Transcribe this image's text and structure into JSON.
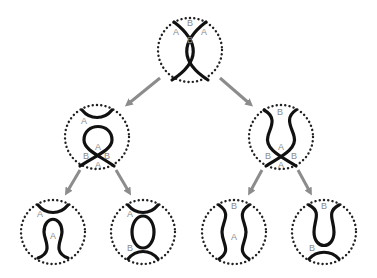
{
  "diagram": {
    "type": "tree of strand-resolution states",
    "colors": {
      "strand": "#111111",
      "boundary": "#222222",
      "label": "#8a8a8a",
      "arrow": "#8c8c8c"
    },
    "nodes": [
      {
        "id": "root",
        "description": "crossing (two strands cross twice)",
        "labels": [
          "A",
          "B",
          "A",
          "B"
        ]
      },
      {
        "id": "mid-left",
        "description": "A-resolution: cap on top, loop with crossing below",
        "labels": [
          "A",
          "A",
          "B",
          "B",
          "A"
        ]
      },
      {
        "id": "mid-right",
        "description": "B-resolution: cup shape with crossing below",
        "labels": [
          "B",
          "A",
          "B",
          "B",
          "A"
        ]
      },
      {
        "id": "leaf-AA",
        "description": "cap on top, bulb below",
        "labels": [
          "A",
          "A"
        ]
      },
      {
        "id": "leaf-AB",
        "description": "cap, closed loop, cup",
        "labels": [
          "A",
          "B"
        ]
      },
      {
        "id": "leaf-BA",
        "description": "two vertical wavy strands",
        "labels": [
          "B",
          "A"
        ]
      },
      {
        "id": "leaf-BB",
        "description": "cup shape and bottom cup",
        "labels": [
          "B",
          "B"
        ]
      }
    ],
    "edges": [
      {
        "from": "root",
        "to": "mid-left"
      },
      {
        "from": "root",
        "to": "mid-right"
      },
      {
        "from": "mid-left",
        "to": "leaf-AA"
      },
      {
        "from": "mid-left",
        "to": "leaf-AB"
      },
      {
        "from": "mid-right",
        "to": "leaf-BA"
      },
      {
        "from": "mid-right",
        "to": "leaf-BB"
      }
    ]
  }
}
